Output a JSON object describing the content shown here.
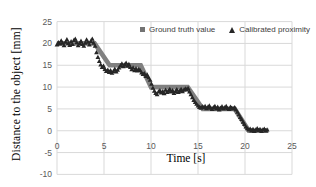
{
  "figure": {
    "x_axis_title": "Time [s]",
    "y_axis_title": "Distance to the object [mm]"
  },
  "legend": {
    "items": [
      {
        "label": "Ground truth value",
        "marker": "square",
        "color": "#737373"
      },
      {
        "label": "Calibrated proximity",
        "marker": "triangle",
        "color": "#262626"
      }
    ]
  },
  "chart_data": {
    "type": "scatter",
    "title": "",
    "xlabel": "Time [s]",
    "ylabel": "Distance to the object [mm]",
    "xlim": [
      0,
      25
    ],
    "ylim": [
      -10,
      25
    ],
    "x_ticks": [
      0,
      5,
      10,
      15,
      20,
      25
    ],
    "y_ticks": [
      25,
      20,
      15,
      10,
      5,
      0,
      -5,
      -10
    ],
    "grid": true,
    "legend_position": "top-inside",
    "colors": {
      "grid": "#d9d9d9",
      "tick_label": "#595959",
      "ground_truth": "#808080",
      "calibrated": "#262626",
      "background": "#ffffff"
    },
    "series": [
      {
        "name": "Ground truth value",
        "marker": "square",
        "color": "#808080",
        "style": "thick-step-band",
        "points": [
          [
            0,
            20
          ],
          [
            4,
            20
          ],
          [
            5.6,
            15
          ],
          [
            8.9,
            15
          ],
          [
            10,
            10
          ],
          [
            13.9,
            10
          ],
          [
            15.5,
            5
          ],
          [
            18.9,
            5
          ],
          [
            20.4,
            0
          ],
          [
            22.5,
            0
          ]
        ]
      },
      {
        "name": "Calibrated proximity",
        "marker": "triangle",
        "color": "#262626",
        "points": [
          [
            0.0,
            19.7
          ],
          [
            0.15,
            20.2
          ],
          [
            0.3,
            19.9
          ],
          [
            0.45,
            20.6
          ],
          [
            0.6,
            20.1
          ],
          [
            0.75,
            19.5
          ],
          [
            0.9,
            20.3
          ],
          [
            1.05,
            20.9
          ],
          [
            1.2,
            20.0
          ],
          [
            1.35,
            19.6
          ],
          [
            1.5,
            20.4
          ],
          [
            1.65,
            19.8
          ],
          [
            1.8,
            20.7
          ],
          [
            1.95,
            21.0
          ],
          [
            2.1,
            20.2
          ],
          [
            2.25,
            19.5
          ],
          [
            2.4,
            20.0
          ],
          [
            2.55,
            20.5
          ],
          [
            2.7,
            19.8
          ],
          [
            2.85,
            19.4
          ],
          [
            3.0,
            20.1
          ],
          [
            3.15,
            20.8
          ],
          [
            3.3,
            20.3
          ],
          [
            3.45,
            19.7
          ],
          [
            3.6,
            20.5
          ],
          [
            3.75,
            21.0
          ],
          [
            3.9,
            20.1
          ],
          [
            4.05,
            19.4
          ],
          [
            4.2,
            17.9
          ],
          [
            4.35,
            16.8
          ],
          [
            4.5,
            15.9
          ],
          [
            4.65,
            15.1
          ],
          [
            4.8,
            14.5
          ],
          [
            4.95,
            14.8
          ],
          [
            5.1,
            14.1
          ],
          [
            5.25,
            13.6
          ],
          [
            5.4,
            13.9
          ],
          [
            5.55,
            13.4
          ],
          [
            5.7,
            13.8
          ],
          [
            5.85,
            13.2
          ],
          [
            6.0,
            13.6
          ],
          [
            6.15,
            14.1
          ],
          [
            6.3,
            13.5
          ],
          [
            6.45,
            13.9
          ],
          [
            6.6,
            14.4
          ],
          [
            6.75,
            14.9
          ],
          [
            6.9,
            15.3
          ],
          [
            7.05,
            14.7
          ],
          [
            7.2,
            15.1
          ],
          [
            7.35,
            15.5
          ],
          [
            7.5,
            14.8
          ],
          [
            7.65,
            15.2
          ],
          [
            7.8,
            14.5
          ],
          [
            7.95,
            14.0
          ],
          [
            8.1,
            14.4
          ],
          [
            8.25,
            13.8
          ],
          [
            8.4,
            14.2
          ],
          [
            8.55,
            13.7
          ],
          [
            8.7,
            14.1
          ],
          [
            8.85,
            13.8
          ],
          [
            9.0,
            13.3
          ],
          [
            9.15,
            12.9
          ],
          [
            9.3,
            13.1
          ],
          [
            9.45,
            12.5
          ],
          [
            9.6,
            12.8
          ],
          [
            9.75,
            12.2
          ],
          [
            9.9,
            11.6
          ],
          [
            10.05,
            10.7
          ],
          [
            10.2,
            9.8
          ],
          [
            10.35,
            9.1
          ],
          [
            10.5,
            8.6
          ],
          [
            10.65,
            8.3
          ],
          [
            10.8,
            8.9
          ],
          [
            10.95,
            9.2
          ],
          [
            11.1,
            8.7
          ],
          [
            11.25,
            9.0
          ],
          [
            11.4,
            8.5
          ],
          [
            11.55,
            9.3
          ],
          [
            11.7,
            8.8
          ],
          [
            11.85,
            9.1
          ],
          [
            12.0,
            9.5
          ],
          [
            12.15,
            8.9
          ],
          [
            12.3,
            9.2
          ],
          [
            12.45,
            8.6
          ],
          [
            12.6,
            9.0
          ],
          [
            12.75,
            9.4
          ],
          [
            12.9,
            8.8
          ],
          [
            13.05,
            9.1
          ],
          [
            13.2,
            9.5
          ],
          [
            13.35,
            9.0
          ],
          [
            13.5,
            9.3
          ],
          [
            13.65,
            9.6
          ],
          [
            13.8,
            9.4
          ],
          [
            13.95,
            9.7
          ],
          [
            14.1,
            8.9
          ],
          [
            14.25,
            8.3
          ],
          [
            14.4,
            7.6
          ],
          [
            14.55,
            7.0
          ],
          [
            14.7,
            6.5
          ],
          [
            14.85,
            6.1
          ],
          [
            15.0,
            5.7
          ],
          [
            15.15,
            5.4
          ],
          [
            15.3,
            5.2
          ],
          [
            15.45,
            5.5
          ],
          [
            15.6,
            5.3
          ],
          [
            15.75,
            5.6
          ],
          [
            15.9,
            5.1
          ],
          [
            16.05,
            5.4
          ],
          [
            16.2,
            5.7
          ],
          [
            16.35,
            5.2
          ],
          [
            16.5,
            4.9
          ],
          [
            16.65,
            5.3
          ],
          [
            16.8,
            5.6
          ],
          [
            16.95,
            5.0
          ],
          [
            17.1,
            5.4
          ],
          [
            17.25,
            4.8
          ],
          [
            17.4,
            5.2
          ],
          [
            17.55,
            5.5
          ],
          [
            17.7,
            5.0
          ],
          [
            17.85,
            5.3
          ],
          [
            18.0,
            5.6
          ],
          [
            18.15,
            5.1
          ],
          [
            18.3,
            4.9
          ],
          [
            18.45,
            5.4
          ],
          [
            18.6,
            5.2
          ],
          [
            18.75,
            5.0
          ],
          [
            18.9,
            5.3
          ],
          [
            19.05,
            4.8
          ],
          [
            19.2,
            4.3
          ],
          [
            19.35,
            3.7
          ],
          [
            19.5,
            3.1
          ],
          [
            19.65,
            2.6
          ],
          [
            19.8,
            2.0
          ],
          [
            19.95,
            1.5
          ],
          [
            20.1,
            0.9
          ],
          [
            20.25,
            0.5
          ],
          [
            20.4,
            0.2
          ],
          [
            20.55,
            0.4
          ],
          [
            20.7,
            0.0
          ],
          [
            20.85,
            0.3
          ],
          [
            21.0,
            -0.1
          ],
          [
            21.15,
            0.2
          ],
          [
            21.3,
            0.5
          ],
          [
            21.45,
            0.1
          ],
          [
            21.6,
            0.3
          ],
          [
            21.75,
            -0.1
          ],
          [
            21.9,
            0.2
          ],
          [
            22.05,
            0.4
          ],
          [
            22.2,
            0.0
          ],
          [
            22.35,
            0.2
          ]
        ]
      }
    ]
  }
}
